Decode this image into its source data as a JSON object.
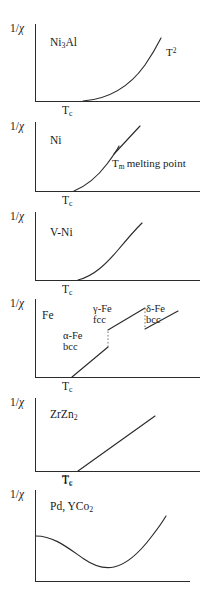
{
  "figure": {
    "axis_label": "1/χ",
    "xlabel": "",
    "ylabel": "1/χ",
    "line_color": "#2b2b2b",
    "background": "#ffffff",
    "panel_count": 6
  },
  "panels": [
    {
      "material": "Ni3Al",
      "material_html": "Ni<sub>3</sub>Al",
      "axis_label": "1/χ",
      "tick_label": "Tc",
      "annotation": "T2",
      "annotation_html": "T<sup>2</sup>",
      "curve_type": "quadratic-rise"
    },
    {
      "material": "Ni",
      "material_html": "Ni",
      "axis_label": "1/χ",
      "tick_label": "Tc",
      "annotation": "Tm melting point",
      "annotation_html": "T<sub>m</sub> melting point",
      "curve_type": "rise-with-discontinuity"
    },
    {
      "material": "V-Ni",
      "material_html": "V-Ni",
      "axis_label": "1/χ",
      "tick_label": "Tc",
      "annotation": "",
      "annotation_html": "",
      "curve_type": "concave-rise"
    },
    {
      "material": "Fe",
      "material_html": "Fe",
      "axis_label": "1/χ",
      "tick_label": "Tc",
      "phases": [
        {
          "name": "alpha-Fe",
          "name_html": "α-Fe",
          "structure": "bcc"
        },
        {
          "name": "gamma-Fe",
          "name_html": "γ-Fe",
          "structure": "fcc"
        },
        {
          "name": "delta-Fe",
          "name_html": "δ-Fe",
          "structure": "bcc"
        }
      ],
      "curve_type": "three-segment-with-jumps"
    },
    {
      "material": "ZrZn2",
      "material_html": "ZrZn<sub>2</sub>",
      "axis_label": "1/χ",
      "tick_label": "Tc",
      "annotation": "",
      "annotation_html": "",
      "curve_type": "linear-rise"
    },
    {
      "material": "Pd, YCo2",
      "material_html": "Pd, YCo<sub>2</sub>",
      "axis_label": "1/χ",
      "tick_label": "Tc",
      "annotation": "",
      "annotation_html": "",
      "curve_type": "minimum-then-rise"
    }
  ],
  "chart_data": {
    "type": "line",
    "title": "",
    "xlabel": "T",
    "ylabel": "1/χ",
    "grid": false,
    "legend": "none",
    "panels": [
      {
        "name": "Ni3Al",
        "label": "Ni3Al",
        "xlabel": "T",
        "ylabel": "1/χ",
        "x_tick_labels": [
          "Tc"
        ],
        "annotations": [
          "T2"
        ],
        "series": [
          {
            "name": "1/chi",
            "x": [
              0.42,
              0.5,
              0.58,
              0.66,
              0.74,
              0.82,
              0.9
            ],
            "y": [
              0.0,
              0.06,
              0.15,
              0.28,
              0.46,
              0.68,
              0.94
            ]
          }
        ],
        "xlim": [
          0,
          1
        ],
        "ylim": [
          0,
          1
        ]
      },
      {
        "name": "Ni",
        "label": "Ni",
        "xlabel": "T",
        "ylabel": "1/χ",
        "x_tick_labels": [
          "Tc"
        ],
        "annotations": [
          "Tm melting point"
        ],
        "series": [
          {
            "name": "below-melting",
            "x": [
              0.4,
              0.48,
              0.56,
              0.64,
              0.7
            ],
            "y": [
              0.0,
              0.16,
              0.36,
              0.57,
              0.7
            ]
          },
          {
            "name": "above-melting",
            "x": [
              0.7,
              0.78,
              0.86
            ],
            "y": [
              0.54,
              0.74,
              0.94
            ]
          }
        ],
        "xlim": [
          0,
          1
        ],
        "ylim": [
          0,
          1
        ]
      },
      {
        "name": "V-Ni",
        "label": "V-Ni",
        "xlabel": "T",
        "ylabel": "1/χ",
        "x_tick_labels": [
          "Tc"
        ],
        "annotations": [],
        "series": [
          {
            "name": "1/chi",
            "x": [
              0.42,
              0.5,
              0.58,
              0.66,
              0.74,
              0.84
            ],
            "y": [
              0.0,
              0.14,
              0.33,
              0.52,
              0.68,
              0.86
            ]
          }
        ],
        "xlim": [
          0,
          1
        ],
        "ylim": [
          0,
          1
        ]
      },
      {
        "name": "Fe",
        "label": "Fe",
        "xlabel": "T",
        "ylabel": "1/χ",
        "x_tick_labels": [
          "Tc"
        ],
        "annotations": [
          "α-Fe bcc",
          "γ-Fe fcc",
          "δ-Fe bcc"
        ],
        "series": [
          {
            "name": "alpha-Fe bcc",
            "x": [
              0.4,
              0.5,
              0.58
            ],
            "y": [
              0.0,
              0.2,
              0.36
            ]
          },
          {
            "name": "gamma-Fe fcc",
            "x": [
              0.58,
              0.68,
              0.78
            ],
            "y": [
              0.5,
              0.66,
              0.82
            ]
          },
          {
            "name": "delta-Fe bcc",
            "x": [
              0.78,
              0.88,
              0.96
            ],
            "y": [
              0.58,
              0.72,
              0.84
            ]
          }
        ],
        "xlim": [
          0,
          1
        ],
        "ylim": [
          0,
          1
        ]
      },
      {
        "name": "ZrZn2",
        "label": "ZrZn2",
        "xlabel": "T",
        "ylabel": "1/χ",
        "x_tick_labels": [
          "Tc"
        ],
        "annotations": [],
        "series": [
          {
            "name": "1/chi",
            "x": [
              0.42,
              0.6,
              0.78,
              0.92
            ],
            "y": [
              0.0,
              0.28,
              0.56,
              0.78
            ]
          }
        ],
        "xlim": [
          0,
          1
        ],
        "ylim": [
          0,
          1
        ]
      },
      {
        "name": "Pd, YCo2",
        "label": "Pd, YCo2",
        "xlabel": "T",
        "ylabel": "1/χ",
        "x_tick_labels": [
          "Tc"
        ],
        "annotations": [],
        "series": [
          {
            "name": "1/chi",
            "x": [
              0.0,
              0.14,
              0.3,
              0.46,
              0.58,
              0.72,
              0.86,
              0.96
            ],
            "y": [
              0.34,
              0.3,
              0.18,
              0.07,
              0.05,
              0.22,
              0.48,
              0.62
            ]
          }
        ],
        "xlim": [
          0,
          1
        ],
        "ylim": [
          0,
          1
        ]
      }
    ]
  }
}
